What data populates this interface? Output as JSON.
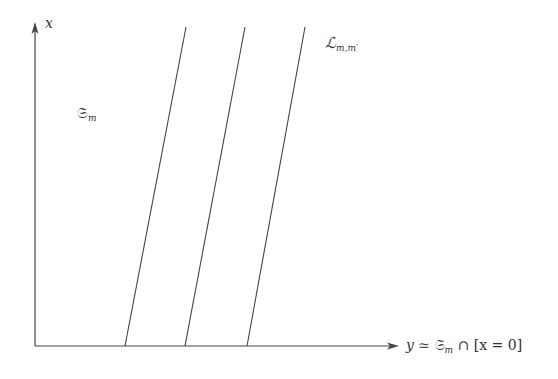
{
  "diagram": {
    "axes": {
      "vertical": {
        "label": "x",
        "direction": "up"
      },
      "horizontal": {
        "label_var": "y",
        "label_rel": " ≃ ",
        "label_set": "𝔖",
        "label_set_sub": "m",
        "label_rest": " ∩ [x = 0]",
        "direction": "right"
      }
    },
    "region_label": {
      "main": "𝔖",
      "sub": "m"
    },
    "lines_label": {
      "main": "ℒ",
      "sub": "m,m′"
    },
    "lines": [
      {
        "x_bottom": 125,
        "x_top": 186
      },
      {
        "x_bottom": 185,
        "x_top": 245
      },
      {
        "x_bottom": 247,
        "x_top": 305
      }
    ],
    "colors": {
      "stroke": "#444444",
      "text": "#333333"
    }
  }
}
